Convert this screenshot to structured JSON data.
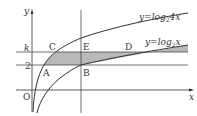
{
  "diagram": {
    "axes": {
      "x_label": "x",
      "y_label": "y",
      "origin_label": "O"
    },
    "curves": [
      {
        "id": "upper",
        "label": "y=log₂4x",
        "label_main": "y=log",
        "label_sub": "2",
        "label_tail": "4x"
      },
      {
        "id": "lower",
        "label": "y=log₂x",
        "label_main": "y=log",
        "label_sub": "2",
        "label_tail": "x"
      }
    ],
    "horizontal_lines": [
      {
        "label": "k",
        "desc": "y = k"
      },
      {
        "label": "2",
        "desc": "y = 2"
      }
    ],
    "points": {
      "A": "A",
      "B": "B",
      "C": "C",
      "D": "D",
      "E": "E"
    },
    "shaded_region": "region bounded by y=log2 4x, y=log2 x, y=2, y=k (ACEB + EBD area)",
    "colors": {
      "stroke": "#333333",
      "shade": "#b9b9b9"
    }
  }
}
